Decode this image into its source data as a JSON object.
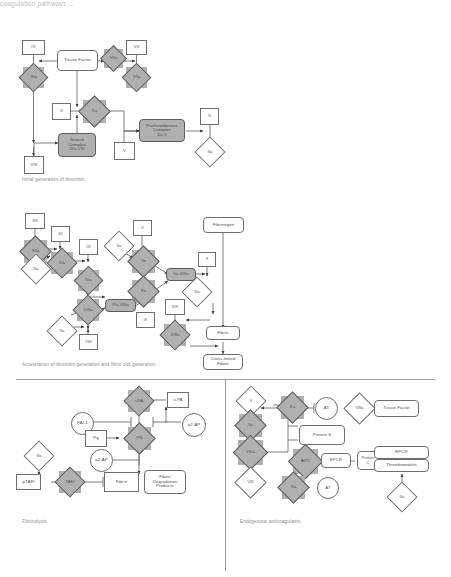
{
  "page": {
    "top_cut_text": "coagulation pathways ...",
    "bg_color": "#ffffff",
    "grey_fill": "#b0b0b0",
    "stroke_color": "#6e6e6e"
  },
  "panels": [
    {
      "id": "initial-generation-of-thrombin",
      "caption": "Initial generation of thrombin.",
      "nodes": [
        {
          "name": "ix",
          "label": "IX",
          "shape": "rect"
        },
        {
          "name": "tissue-factor",
          "label": "Tissue Factor",
          "shape": "round"
        },
        {
          "name": "viia",
          "label": "VIIa",
          "shape": "diamond-grey"
        },
        {
          "name": "vii",
          "label": "VII",
          "shape": "rect"
        },
        {
          "name": "ixa",
          "label": "IXa",
          "shape": "diamond-grey"
        },
        {
          "name": "viia-2",
          "label": "VIIa",
          "shape": "diamond-grey"
        },
        {
          "name": "x",
          "label": "X",
          "shape": "rect"
        },
        {
          "name": "xa",
          "label": "Xa",
          "shape": "diamond-grey"
        },
        {
          "name": "ii",
          "label": "II",
          "shape": "rect"
        },
        {
          "name": "prothrombinase-complex",
          "label": "Prothrombinase\nComplex\nXa-V",
          "shape": "round-grey"
        },
        {
          "name": "tenase-complex",
          "label": "Tenase\nComplex\nIXa-VIII",
          "shape": "round-grey"
        },
        {
          "name": "v",
          "label": "V",
          "shape": "rect"
        },
        {
          "name": "iia",
          "label": "IIa",
          "shape": "diamond"
        },
        {
          "name": "viii",
          "label": "VIII",
          "shape": "rect"
        }
      ]
    },
    {
      "id": "acceleration-of-thrombin-generation",
      "caption": "Acceleration of thrombin generation and fibrin clot generation.",
      "nodes": [
        {
          "name": "xii",
          "label": "XII",
          "shape": "rect"
        },
        {
          "name": "xi",
          "label": "XI",
          "shape": "rect"
        },
        {
          "name": "ix",
          "label": "IX",
          "shape": "rect"
        },
        {
          "name": "v",
          "label": "V",
          "shape": "rect"
        },
        {
          "name": "fibrinogen",
          "label": "Fibrinogen",
          "shape": "round"
        },
        {
          "name": "xiia",
          "label": "XIIa",
          "shape": "diamond-grey"
        },
        {
          "name": "xia",
          "label": "XIa",
          "shape": "diamond-grey"
        },
        {
          "name": "ixa",
          "label": "IXa",
          "shape": "diamond-grey"
        },
        {
          "name": "viiia",
          "label": "VIIIa",
          "shape": "diamond-grey"
        },
        {
          "name": "iia-1",
          "label": "IIa",
          "shape": "diamond"
        },
        {
          "name": "iia-2",
          "label": "IIa",
          "shape": "diamond"
        },
        {
          "name": "iia-3",
          "label": "IIa",
          "shape": "diamond"
        },
        {
          "name": "iia-4",
          "label": "IIa",
          "shape": "diamond"
        },
        {
          "name": "va",
          "label": "Va",
          "shape": "diamond-grey"
        },
        {
          "name": "xa",
          "label": "Xa",
          "shape": "diamond-grey"
        },
        {
          "name": "ixa-viiia",
          "label": "IXa-VIIIa",
          "shape": "round-grey"
        },
        {
          "name": "xa-va",
          "label": "Xa-VIIIa",
          "shape": "round-grey"
        },
        {
          "name": "ii",
          "label": "II",
          "shape": "rect"
        },
        {
          "name": "x",
          "label": "X",
          "shape": "rect"
        },
        {
          "name": "xiii",
          "label": "XIII",
          "shape": "rect"
        },
        {
          "name": "xiiia",
          "label": "XIIIa",
          "shape": "diamond-grey"
        },
        {
          "name": "viii",
          "label": "VIII",
          "shape": "rect"
        },
        {
          "name": "fibrin",
          "label": "Fibrin",
          "shape": "round"
        },
        {
          "name": "cross-linked-fibrin",
          "label": "Cross-linked\nFibrin",
          "shape": "round"
        }
      ]
    },
    {
      "id": "fibrinolysis",
      "caption": "Fibrinolysis.",
      "nodes": [
        {
          "name": "t-pa",
          "label": "t-PA",
          "shape": "diamond-grey"
        },
        {
          "name": "u-pa",
          "label": "u-PA",
          "shape": "rect"
        },
        {
          "name": "pai-1",
          "label": "PAI-1",
          "shape": "circle"
        },
        {
          "name": "a2-ap-1",
          "label": "α2-AP",
          "shape": "circle"
        },
        {
          "name": "pg",
          "label": "Pg",
          "shape": "rect"
        },
        {
          "name": "pn",
          "label": "PN",
          "shape": "diamond-grey"
        },
        {
          "name": "a2-ap-2",
          "label": "α2-AP",
          "shape": "circle"
        },
        {
          "name": "iia",
          "label": "IIa",
          "shape": "diamond"
        },
        {
          "name": "ptafi",
          "label": "pTAFI",
          "shape": "rect"
        },
        {
          "name": "tafi",
          "label": "TAFI",
          "shape": "diamond-grey"
        },
        {
          "name": "fibrin",
          "label": "Fibrin",
          "shape": "rect"
        },
        {
          "name": "fibrin-degradation-products",
          "label": "Fibrin\nDegradation\nProducts",
          "shape": "round"
        }
      ]
    },
    {
      "id": "endogenous-anticoagulants",
      "caption": "Endogenous anticoagulants.",
      "nodes": [
        {
          "name": "v",
          "label": "V",
          "shape": "diamond"
        },
        {
          "name": "va",
          "label": "Va",
          "shape": "diamond-grey"
        },
        {
          "name": "viiia",
          "label": "VIIIa",
          "shape": "diamond-grey"
        },
        {
          "name": "viii",
          "label": "VIII",
          "shape": "diamond"
        },
        {
          "name": "xa-1",
          "label": "Xa",
          "shape": "diamond-grey"
        },
        {
          "name": "at-1",
          "label": "AT",
          "shape": "circle"
        },
        {
          "name": "viia",
          "label": "VIIa",
          "shape": "diamond"
        },
        {
          "name": "tissue-factor",
          "label": "Tissue Factor",
          "shape": "round"
        },
        {
          "name": "protein-s",
          "label": "Protein S",
          "shape": "round"
        },
        {
          "name": "apc",
          "label": "APC",
          "shape": "diamond-grey"
        },
        {
          "name": "epcr-1",
          "label": "EPCR",
          "shape": "round"
        },
        {
          "name": "protein-c",
          "label": "Protein\nC",
          "shape": "round"
        },
        {
          "name": "epcr-2",
          "label": "EPCR",
          "shape": "round"
        },
        {
          "name": "thrombomodulin",
          "label": "Thrombomodulin",
          "shape": "round"
        },
        {
          "name": "xa-2",
          "label": "Xa",
          "shape": "diamond-grey"
        },
        {
          "name": "at-2",
          "label": "AT",
          "shape": "circle"
        },
        {
          "name": "iia",
          "label": "IIa",
          "shape": "diamond"
        }
      ]
    }
  ]
}
